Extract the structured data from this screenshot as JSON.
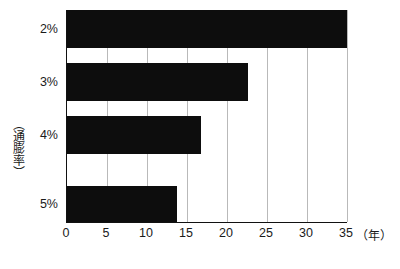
{
  "chart_data": {
    "type": "bar",
    "orientation": "horizontal",
    "title": "",
    "subtitle": "",
    "xlabel": "（年）",
    "ylabel": "（通膨率）",
    "categories": [
      "2%",
      "3%",
      "4%",
      "5%"
    ],
    "values": [
      35.0,
      22.6,
      16.8,
      13.8
    ],
    "series": [
      {
        "name": "",
        "values": [
          35.0,
          22.6,
          16.8,
          13.8
        ]
      }
    ],
    "xlim": [
      0,
      37
    ],
    "ylim": [
      0,
      4
    ],
    "x_ticks": [
      0,
      5,
      10,
      15,
      20,
      25,
      30,
      35
    ],
    "x_tick_labels": [
      "0",
      "5",
      "10",
      "15",
      "20",
      "25",
      "30",
      "35"
    ],
    "y_tick_labels": [
      "2%",
      "3%",
      "4%",
      "5%"
    ],
    "grid": "vertical-only",
    "legend": "none",
    "bar_color": "#0d0d0d",
    "grid_color": "#b9b9b9",
    "axis_color": "#111111",
    "background_color": "#ffffff",
    "annotations": []
  },
  "axes": {
    "y_caption": "（通膨率）",
    "x_caption": "（年）"
  }
}
